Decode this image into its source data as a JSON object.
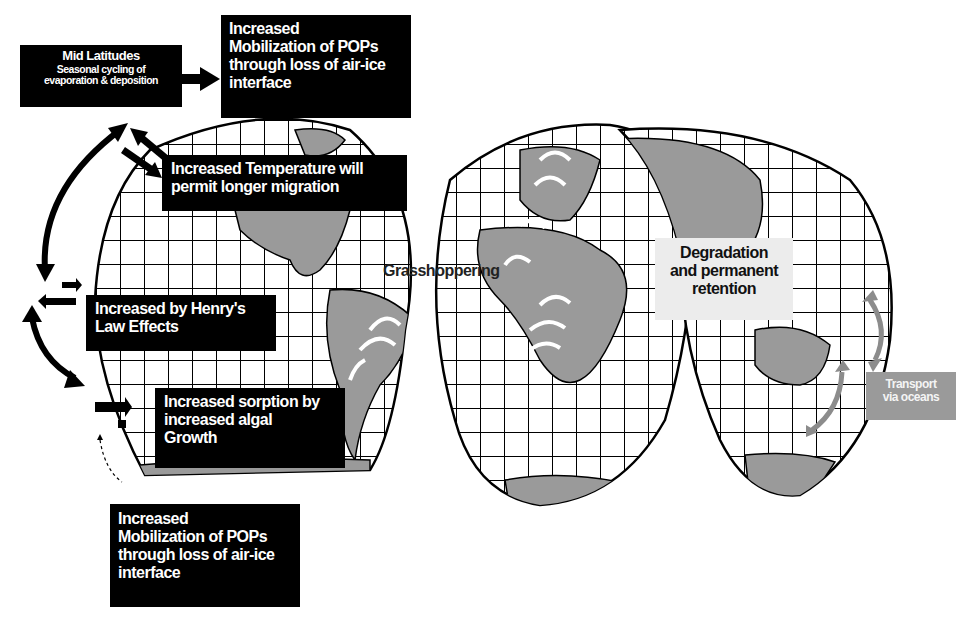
{
  "diagram": {
    "colors": {
      "land": "#9a9a9a",
      "grid": "#000000",
      "box_dark": "#000000",
      "box_light": "#ececec",
      "box_grey": "#9a9a9a",
      "ocean_arrow": "#8c8c8c",
      "grasshopper_arrow": "#ffffff"
    },
    "boxes": {
      "mid_latitudes": {
        "title": "Mid Latitudes",
        "line1": "Seasonal cycling of",
        "line2": "evaporation & deposition"
      },
      "mobilization_top": {
        "line1": "Increased",
        "line2": "Mobilization of POPs",
        "line3": "through loss of air-ice",
        "line4": "interface"
      },
      "temperature": {
        "line1": "Increased Temperature will",
        "line2": "permit longer migration"
      },
      "henrys_law": {
        "line1": "Increased by Henry's",
        "line2": "Law Effects"
      },
      "sorption": {
        "line1": "Increased sorption by",
        "line2": "increased algal",
        "line3": "Growth"
      },
      "mobilization_bottom": {
        "line1": "Increased",
        "line2": "Mobilization of POPs",
        "line3": "through loss of air-ice",
        "line4": "interface"
      },
      "degradation": {
        "line1": "Degradation",
        "line2": "and permanent",
        "line3": "retention"
      },
      "transport": {
        "line1": "Transport",
        "line2": "via oceans"
      }
    },
    "labels": {
      "grasshoppering": "Grasshoppering"
    },
    "icons": [
      "curved-double-arrow-icon",
      "double-arrow-icon",
      "right-arrow-icon",
      "white-curved-arrow-icon",
      "grey-ocean-arrow-icon"
    ]
  }
}
